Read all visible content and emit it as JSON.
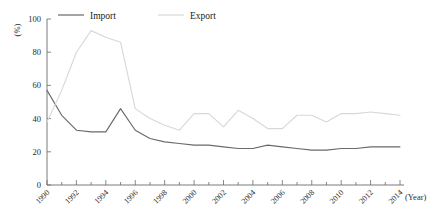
{
  "chart_data": {
    "type": "line",
    "title": "",
    "xlabel": "(Year)",
    "ylabel": "(%)",
    "xlim": [
      1990,
      2014
    ],
    "ylim": [
      0,
      100
    ],
    "grid": false,
    "legend_position": "top-center",
    "ytick_labels": [
      "0",
      "20",
      "40",
      "60",
      "80",
      "100"
    ],
    "ytick_values": [
      0,
      20,
      40,
      60,
      80,
      100
    ],
    "xtick_labels": [
      "1990",
      "1992",
      "1994",
      "1996",
      "1998",
      "2000",
      "2002",
      "2004",
      "2006",
      "2008",
      "2010",
      "2012",
      "2014"
    ],
    "xtick_values": [
      1990,
      1992,
      1994,
      1996,
      1998,
      2000,
      2002,
      2004,
      2006,
      2008,
      2010,
      2012,
      2014
    ],
    "x": [
      1990,
      1991,
      1992,
      1993,
      1994,
      1995,
      1996,
      1997,
      1998,
      1999,
      2000,
      2001,
      2002,
      2003,
      2004,
      2005,
      2006,
      2007,
      2008,
      2009,
      2010,
      2011,
      2012,
      2013,
      2014
    ],
    "series": [
      {
        "name": "Import",
        "color": "#6a6a6a",
        "values": [
          57,
          42,
          33,
          32,
          32,
          46,
          33,
          28,
          26,
          25,
          24,
          24,
          23,
          22,
          22,
          24,
          23,
          22,
          21,
          21,
          22,
          22,
          23,
          23,
          23
        ]
      },
      {
        "name": "Export",
        "color": "#d8d8d8",
        "values": [
          38,
          57,
          80,
          93,
          89,
          86,
          46,
          40,
          36,
          33,
          43,
          43,
          35,
          45,
          40,
          34,
          34,
          42,
          42,
          38,
          43,
          43,
          44,
          43,
          42
        ]
      }
    ]
  },
  "legend": {
    "items": [
      {
        "label": "Import",
        "color": "#6a6a6a"
      },
      {
        "label": "Export",
        "color": "#d8d8d8"
      }
    ]
  },
  "axes": {
    "y_unit": "(%)",
    "x_unit": "(Year)"
  }
}
